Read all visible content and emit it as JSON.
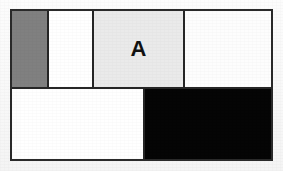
{
  "figure": {
    "kind": "grid-table",
    "background_color": "#fbfbfb",
    "border_color": "#2a2a2a",
    "border_width_px": 2,
    "frame": {
      "x": 10,
      "y": 9,
      "width": 263,
      "height": 152
    }
  },
  "grid": {
    "rows": [
      {
        "name": "top-row",
        "height_px": 78,
        "cells": [
          {
            "name": "cell-top-1",
            "label": "",
            "fill_color": "#808080",
            "width_px": 37,
            "fill_name": "gray"
          },
          {
            "name": "cell-top-2",
            "label": "",
            "fill_color": "#ffffff",
            "width_px": 45,
            "fill_name": "white"
          },
          {
            "name": "cell-top-3",
            "label": "A",
            "fill_color": "#eaeaea",
            "width_px": 91,
            "fill_name": "light-gray"
          },
          {
            "name": "cell-top-4",
            "label": "",
            "fill_color": "#fdfdfd",
            "width_px": 86,
            "fill_name": "white"
          }
        ]
      },
      {
        "name": "bottom-row",
        "height_px": 70,
        "cells": [
          {
            "name": "cell-bottom-1",
            "label": "",
            "fill_color": "#ffffff",
            "width_px": 133,
            "fill_name": "white"
          },
          {
            "name": "cell-bottom-2",
            "label": "",
            "fill_color": "#050505",
            "width_px": 126,
            "fill_name": "black"
          }
        ]
      }
    ]
  }
}
